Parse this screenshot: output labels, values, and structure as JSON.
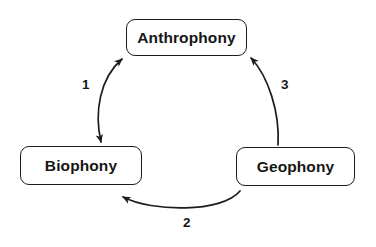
{
  "diagram": {
    "background_color": "#ffffff",
    "stroke_color": "#1c1c1c",
    "text_color": "#161616",
    "nodes": [
      {
        "id": "anthrophony",
        "label": "Anthrophony"
      },
      {
        "id": "biophony",
        "label": "Biophony"
      },
      {
        "id": "geophony",
        "label": "Geophony"
      }
    ],
    "edges": [
      {
        "id": "edge-1",
        "label": "1",
        "from": "biophony",
        "to": "anthrophony",
        "direction": "bidirectional"
      },
      {
        "id": "edge-2",
        "label": "2",
        "from": "geophony",
        "to": "biophony",
        "direction": "unidirectional"
      },
      {
        "id": "edge-3",
        "label": "3",
        "from": "geophony",
        "to": "anthrophony",
        "direction": "unidirectional"
      }
    ]
  }
}
